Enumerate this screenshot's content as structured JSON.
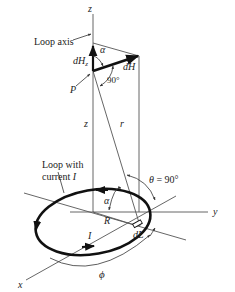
{
  "diagram": {
    "labels": {
      "z_axis_top": "z",
      "loop_axis": "Loop axis",
      "dHz": "dH",
      "dHz_sub": "z",
      "alpha_top": "α",
      "dH": "dH",
      "right_angle": "90°",
      "point": "P",
      "z_height": "z",
      "r": "r",
      "loop_line1": "Loop with",
      "loop_line2": "current ",
      "loop_current": "I",
      "theta": "θ = 90°",
      "alpha_bottom": "α",
      "R": "R",
      "I": "I",
      "dL": "dL",
      "y_axis": "y",
      "phi": "ϕ",
      "x_axis": "x"
    },
    "colors": {
      "line": "#444444",
      "thick": "#111111",
      "text": "#222222"
    }
  }
}
